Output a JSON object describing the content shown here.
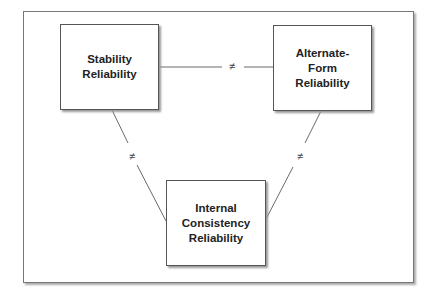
{
  "nodes": [
    {
      "id": "stability",
      "label": "Stability\nReliability"
    },
    {
      "id": "alternate",
      "label": "Alternate-\nForm\nReliability"
    },
    {
      "id": "internal",
      "label": "Internal\nConsistency\nReliability"
    }
  ],
  "edges": [
    {
      "from": "stability",
      "to": "alternate",
      "label": "≠"
    },
    {
      "from": "stability",
      "to": "internal",
      "label": "≠"
    },
    {
      "from": "alternate",
      "to": "internal",
      "label": "≠"
    }
  ]
}
